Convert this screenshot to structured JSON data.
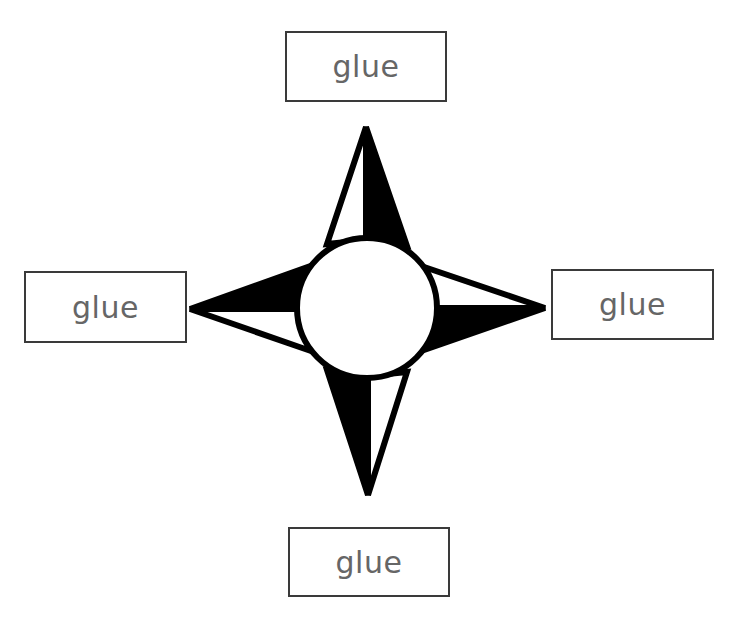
{
  "labels": {
    "north": "glue",
    "west": "glue",
    "east": "glue",
    "south": "glue"
  },
  "colors": {
    "fill_dark": "#000000",
    "fill_light": "#ffffff",
    "text": "#666666",
    "box_border": "#3a3a3a"
  }
}
